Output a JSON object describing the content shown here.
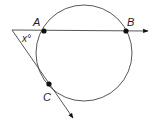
{
  "diagram": {
    "type": "geometry-circle-tangent-secant",
    "colors": {
      "stroke": "#444444",
      "point": "#111111",
      "text": "#222222"
    },
    "circle": {
      "cx": 84,
      "cy": 53,
      "r": 48
    },
    "vertex": {
      "x": 12,
      "y": 30
    },
    "points": [
      {
        "label": "A",
        "x": 44,
        "y": 31,
        "lx": 33,
        "ly": 26
      },
      {
        "label": "B",
        "x": 126,
        "y": 31,
        "lx": 127,
        "ly": 26
      },
      {
        "label": "C",
        "x": 49,
        "y": 84,
        "lx": 43,
        "ly": 101
      }
    ],
    "angle_label": {
      "text": "x°",
      "x": 22,
      "y": 42
    },
    "rays": [
      {
        "name": "ray-through-A-B",
        "x2": 148,
        "y2": 31
      },
      {
        "name": "ray-through-C",
        "x2": 73,
        "y2": 118
      }
    ]
  }
}
